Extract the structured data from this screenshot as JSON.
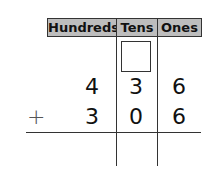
{
  "header": {
    "columns": [
      "Hundreds",
      "Tens",
      "Ones"
    ]
  },
  "problem": {
    "operator": "+",
    "addend1": {
      "hundreds": "4",
      "tens": "3",
      "ones": "6"
    },
    "addend2": {
      "hundreds": "3",
      "tens": "0",
      "ones": "6"
    },
    "regroup_box": "",
    "answer": {
      "hundreds": "",
      "tens": "",
      "ones": ""
    }
  }
}
